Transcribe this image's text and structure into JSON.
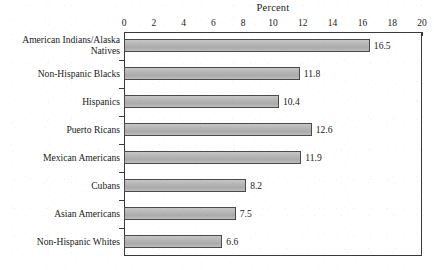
{
  "chart_data": {
    "type": "bar",
    "orientation": "horizontal",
    "title": "Percent",
    "xlabel": "Percent",
    "ylabel": "",
    "xlim": [
      0,
      20
    ],
    "xticks": [
      0,
      2,
      4,
      6,
      8,
      10,
      12,
      14,
      16,
      18,
      20
    ],
    "xtick_labels": [
      "0",
      "2",
      "4",
      "6",
      "8",
      "10",
      "12",
      "14",
      "16",
      "18",
      "20"
    ],
    "grid": false,
    "legend": null,
    "bar_color": "#b9b9b9",
    "bar_edge_color": "#4a4a4a",
    "frame_color": "#3a3a3a",
    "text_color": "#1a1a1a",
    "categories": [
      "American Indians/Alaska\nNatives",
      "Non-Hispanic Blacks",
      "Hispanics",
      "Puerto Ricans",
      "Mexican Americans",
      "Cubans",
      "Asian Americans",
      "Non-Hispanic Whites"
    ],
    "values": [
      16.5,
      11.8,
      10.4,
      12.6,
      11.9,
      8.2,
      7.5,
      6.6
    ],
    "value_labels": [
      "16.5",
      "11.8",
      "10.4",
      "12.6",
      "11.9",
      "8.2",
      "7.5",
      "6.6"
    ]
  }
}
